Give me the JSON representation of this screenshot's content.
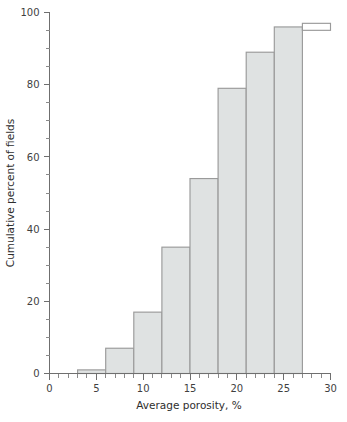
{
  "figure": {
    "name": "cumulative-porosity-step-chart",
    "background_color": "#ffffff"
  },
  "bottom_caption": {
    "text": "cropped caption line",
    "visible": false
  },
  "colors": {
    "axis": "#6f6f6f",
    "tick_minor": "#8a8a8a",
    "step_fill": "#dfe2e2",
    "step_stroke": "#9a9a9a",
    "text": "#2e2e2e"
  },
  "chart_data": {
    "type": "bar",
    "title": "",
    "subtitle": "",
    "xlabel": "Average porosity, %",
    "ylabel": "Cumulative percent of fields",
    "xlim": [
      0,
      30
    ],
    "ylim": [
      0,
      100
    ],
    "grid": false,
    "legend": false,
    "legend_position": "none",
    "x_major_ticks": [
      0,
      5,
      10,
      15,
      20,
      25,
      30
    ],
    "x_major_tick_labels": [
      "0",
      "5",
      "10",
      "15",
      "20",
      "25",
      "30"
    ],
    "x_minor_tick_step": 1,
    "y_major_ticks": [
      0,
      20,
      40,
      60,
      80,
      100
    ],
    "y_major_tick_labels": [
      "0",
      "20",
      "40",
      "60",
      "80",
      "100"
    ],
    "y_minor_tick_step": 5,
    "bin_width": 3,
    "bins": [
      {
        "x_start": 3,
        "x_end": 6,
        "cumulative_percent": 1,
        "filled": true
      },
      {
        "x_start": 6,
        "x_end": 9,
        "cumulative_percent": 7,
        "filled": true
      },
      {
        "x_start": 9,
        "x_end": 12,
        "cumulative_percent": 17,
        "filled": true
      },
      {
        "x_start": 12,
        "x_end": 15,
        "cumulative_percent": 35,
        "filled": true
      },
      {
        "x_start": 15,
        "x_end": 18,
        "cumulative_percent": 54,
        "filled": true
      },
      {
        "x_start": 18,
        "x_end": 21,
        "cumulative_percent": 79,
        "filled": true
      },
      {
        "x_start": 21,
        "x_end": 24,
        "cumulative_percent": 89,
        "filled": true
      },
      {
        "x_start": 24,
        "x_end": 27,
        "cumulative_percent": 96,
        "filled": true
      },
      {
        "x_start": 27,
        "x_end": 30,
        "cumulative_percent": 97,
        "filled": false
      }
    ],
    "categories": [
      "3-6",
      "6-9",
      "9-12",
      "12-15",
      "15-18",
      "18-21",
      "21-24",
      "24-27",
      "27-30"
    ],
    "values": [
      1,
      7,
      17,
      35,
      54,
      79,
      89,
      96,
      97
    ]
  }
}
